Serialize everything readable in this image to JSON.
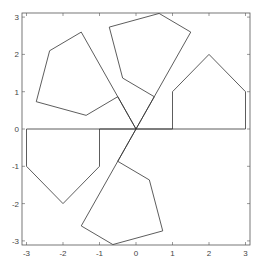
{
  "chart_data": {
    "type": "line",
    "title": "",
    "xlabel": "",
    "ylabel": "",
    "xlim": [
      -3.1,
      3.1
    ],
    "ylim": [
      -3.1,
      3.1
    ],
    "xticks": [
      -3,
      -2,
      -1,
      0,
      1,
      2,
      3
    ],
    "yticks": [
      -3,
      -2,
      -1,
      0,
      1,
      2,
      3
    ],
    "xtick_labels": [
      "-3",
      "-2",
      "-1",
      "0",
      "1",
      "2",
      "3"
    ],
    "ytick_labels": [
      "-3",
      "-2",
      "-1",
      "0",
      "1",
      "2",
      "3"
    ],
    "grid": false,
    "legend": null,
    "base_polygon": [
      [
        0,
        0
      ],
      [
        3,
        0
      ],
      [
        3,
        1
      ],
      [
        2,
        2
      ],
      [
        1,
        1
      ],
      [
        1,
        0
      ]
    ],
    "rotations_deg": [
      0,
      60,
      120,
      180,
      240
    ],
    "series": [
      {
        "name": "rot0",
        "points": [
          [
            0,
            0
          ],
          [
            3,
            0
          ],
          [
            3,
            1
          ],
          [
            2,
            2
          ],
          [
            1,
            1
          ],
          [
            1,
            0
          ]
        ]
      },
      {
        "name": "rot60",
        "points": [
          [
            0,
            0
          ],
          [
            1.5,
            2.598
          ],
          [
            0.634,
            3.098
          ],
          [
            -0.732,
            2.732
          ],
          [
            -0.366,
            1.366
          ],
          [
            0.5,
            0.866
          ]
        ]
      },
      {
        "name": "rot120",
        "points": [
          [
            0,
            0
          ],
          [
            -1.5,
            2.598
          ],
          [
            -2.366,
            2.098
          ],
          [
            -2.732,
            0.732
          ],
          [
            -1.366,
            0.366
          ],
          [
            -0.5,
            0.866
          ]
        ]
      },
      {
        "name": "rot180",
        "points": [
          [
            0,
            0
          ],
          [
            -3,
            0
          ],
          [
            -3,
            -1
          ],
          [
            -2,
            -2
          ],
          [
            -1,
            -1
          ],
          [
            -1,
            0
          ]
        ]
      },
      {
        "name": "rot240",
        "points": [
          [
            0,
            0
          ],
          [
            -1.5,
            -2.598
          ],
          [
            -0.634,
            -3.098
          ],
          [
            0.732,
            -2.732
          ],
          [
            0.366,
            -1.366
          ],
          [
            -0.5,
            -0.866
          ]
        ]
      }
    ],
    "stroke_color": "#333333"
  }
}
